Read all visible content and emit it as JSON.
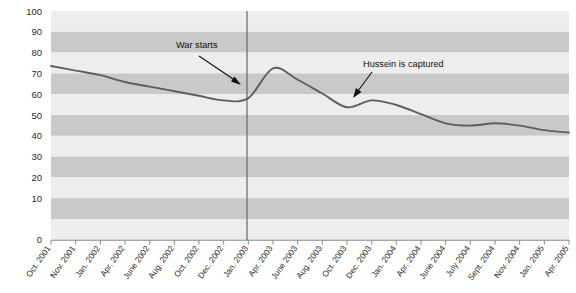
{
  "chart_data": {
    "type": "line",
    "title": "",
    "subtitle": "",
    "xlabel": "",
    "ylabel": "",
    "ylim": [
      0,
      100
    ],
    "yticks": [
      0,
      10,
      20,
      30,
      40,
      50,
      60,
      70,
      80,
      90,
      100
    ],
    "grid": "horizontal-banded",
    "legend": "none",
    "line_color": "#5e5e5e",
    "band_light_color": "#ededed",
    "band_dark_color": "#c9c9c9",
    "axis_color": "#808080",
    "categories": [
      "Oct. 2001",
      "Nov. 2001",
      "Jan. 2002",
      "Apr. 2002",
      "June 2002",
      "Aug. 2002",
      "Oct. 2002",
      "Dec. 2002",
      "Jan. 2003",
      "Apr. 2003",
      "June 2003",
      "Aug. 2003",
      "Oct. 2003",
      "Dec. 2003",
      "Jan. 2004",
      "Apr. 2004",
      "June 2004",
      "July 2004",
      "Sept. 2004",
      "Nov. 2004",
      "Jan. 2005",
      "Apr. 2005"
    ],
    "values": [
      76,
      74,
      72,
      69,
      67,
      65,
      63,
      61,
      62,
      75,
      70,
      64,
      58,
      61,
      59,
      55,
      51,
      50,
      51,
      50,
      48,
      47
    ],
    "series": [
      {
        "name": "Approval",
        "values": [
          76,
          74,
          72,
          69,
          67,
          65,
          63,
          61,
          62,
          75,
          70,
          64,
          58,
          61,
          59,
          55,
          51,
          50,
          51,
          50,
          48,
          47
        ]
      }
    ],
    "annotations": [
      {
        "label": "War starts",
        "target_category": "Apr. 2003",
        "target_value": 72,
        "marker": "vertical-line-plus-arrow"
      },
      {
        "label": "Hussein is captured",
        "target_category": "Dec. 2003",
        "target_value": 62,
        "marker": "arrow"
      }
    ]
  }
}
